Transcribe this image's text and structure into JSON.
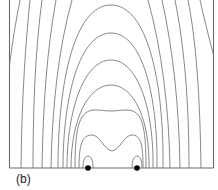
{
  "figure": {
    "panel_label": "(b)",
    "colors": {
      "contour": "#7a7a7a",
      "frame": "#6a6a6a",
      "source_dot": "#000000",
      "background": "#ffffff"
    },
    "sources": [
      {
        "x": 88,
        "y": 168
      },
      {
        "x": 137,
        "y": 168
      }
    ]
  }
}
